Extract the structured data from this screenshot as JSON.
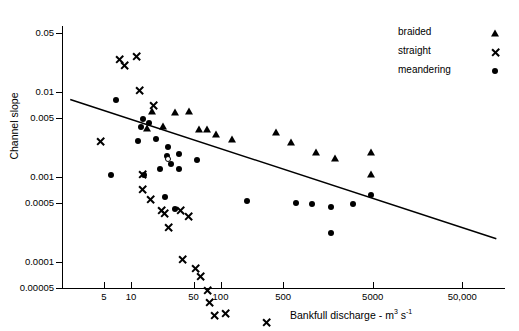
{
  "chart_data": {
    "type": "scatter",
    "title": "",
    "xlabel": "Bankfull discharge - m3 s-1",
    "xlabel_main": "Bankfull discharge  -  m",
    "xlabel_sup1": "3",
    "xlabel_mid": " s",
    "xlabel_sup2": "-1",
    "ylabel": "Channel slope",
    "xscale": "log",
    "yscale": "log",
    "xlim": [
      1.7,
      150000
    ],
    "ylim": [
      5e-05,
      0.06
    ],
    "grid": false,
    "legend_position": "top-right",
    "xticks": [
      5,
      10,
      50,
      100,
      500,
      5000,
      50000
    ],
    "xticklabels": [
      "5",
      "10",
      "50",
      "100",
      "500",
      "5000",
      "50,000"
    ],
    "yticks": [
      0.05,
      0.01,
      0.005,
      0.001,
      0.0005,
      0.0001,
      5e-05
    ],
    "yticklabels": [
      "0.05",
      "0.01",
      "0.005",
      "0.001",
      "0.0005",
      "0.0001",
      "0.00005"
    ],
    "legend": [
      {
        "label": "braided",
        "marker": "triangle"
      },
      {
        "label": "straight",
        "marker": "x"
      },
      {
        "label": "meandering",
        "marker": "circle"
      }
    ],
    "trendline": {
      "x": [
        2.1,
        120000
      ],
      "y": [
        0.0082,
        0.00019
      ]
    },
    "series": [
      {
        "name": "straight",
        "marker": "x",
        "points": [
          [
            7.5,
            0.0245
          ],
          [
            11.5,
            0.0335
          ],
          [
            8.5,
            0.0335
          ],
          [
            12.5,
            0.0215
          ],
          [
            18,
            0.0185
          ],
          [
            4.6,
            0.009
          ],
          [
            13.5,
            0.0047
          ],
          [
            13.5,
            0.004
          ],
          [
            16.5,
            0.0038
          ],
          [
            22,
            0.0036
          ],
          [
            24,
            0.0043
          ],
          [
            26,
            0.0037
          ],
          [
            36,
            0.0075
          ],
          [
            44,
            0.0082
          ],
          [
            38,
            0.0033
          ],
          [
            52,
            0.0033
          ],
          [
            60,
            0.0034
          ],
          [
            72,
            0.0029
          ],
          [
            76,
            0.0027
          ],
          [
            86,
            0.0024
          ],
          [
            115,
            0.0033
          ],
          [
            330,
            0.0033
          ],
          [
            420,
            0.0024
          ],
          [
            27,
            0.0019
          ],
          [
            24,
            0.0014
          ],
          [
            60,
            0.00075
          ],
          [
            105,
            0.00082
          ],
          [
            105,
            0.00062
          ]
        ]
      },
      {
        "name": "braided",
        "marker": "triangle",
        "points": [
          [
            17,
            0.006
          ],
          [
            31,
            0.0059
          ],
          [
            15,
            0.0038
          ],
          [
            44,
            0.006
          ],
          [
            23,
            0.004
          ],
          [
            58,
            0.0037
          ],
          [
            70,
            0.0037
          ],
          [
            90,
            0.0032
          ],
          [
            135,
            0.0028
          ],
          [
            420,
            0.0034
          ],
          [
            620,
            0.0026
          ],
          [
            1150,
            0.002
          ],
          [
            1900,
            0.0017
          ],
          [
            4800,
            0.002
          ],
          [
            4800,
            0.0011
          ]
        ]
      },
      {
        "name": "meandering",
        "marker": "circle",
        "points": [
          [
            6.8,
            0.0082
          ],
          [
            13.5,
            0.0048
          ],
          [
            16,
            0.0044
          ],
          [
            13,
            0.0039
          ],
          [
            12,
            0.0027
          ],
          [
            19,
            0.0028
          ],
          [
            26,
            0.0023
          ],
          [
            25,
            0.0018
          ],
          [
            6.0,
            0.00105
          ],
          [
            14,
            0.00105
          ],
          [
            21,
            0.00125
          ],
          [
            28,
            0.00145
          ],
          [
            34,
            0.00125
          ],
          [
            55,
            0.0016
          ],
          [
            24,
            0.00058
          ],
          [
            31,
            0.00042
          ],
          [
            200,
            0.00052
          ],
          [
            700,
            0.0005
          ],
          [
            1050,
            0.00048
          ],
          [
            1700,
            0.00045
          ],
          [
            1700,
            0.00022
          ],
          [
            4800,
            0.00062
          ],
          [
            34,
            0.0019
          ],
          [
            3000,
            0.00048
          ]
        ],
        "open_points": [
          [
            26,
            0.00165
          ]
        ]
      }
    ]
  }
}
